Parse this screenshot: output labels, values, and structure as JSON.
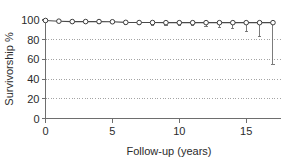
{
  "chart_data": {
    "type": "line",
    "title": "",
    "subtitle": "",
    "xlabel": "Follow-up (years)",
    "ylabel": "Survivorship %",
    "xlim": [
      0,
      17.6
    ],
    "ylim": [
      0,
      100
    ],
    "xticks": [
      0,
      5,
      10,
      15
    ],
    "xtick_labels": [
      "0",
      "5",
      "10",
      "15"
    ],
    "yticks": [
      0,
      20,
      40,
      60,
      80,
      100
    ],
    "ytick_labels": [
      "0",
      "20",
      "40",
      "60",
      "80",
      "100"
    ],
    "grid": "horizontal-dotted",
    "gridlines_at": [
      20,
      40,
      60,
      80
    ],
    "legend": "none",
    "marker": "open-circle",
    "errorbar_direction": "down",
    "x": [
      0,
      1,
      2,
      3,
      4,
      5,
      6,
      7,
      8,
      9,
      10,
      11,
      12,
      13,
      14,
      15,
      16,
      17
    ],
    "values": [
      99.5,
      98.8,
      98.4,
      98.4,
      98.4,
      98.2,
      97.6,
      97.4,
      97.4,
      97.3,
      97.3,
      97.3,
      97.3,
      97.3,
      97.3,
      97.3,
      97.3,
      97.3
    ],
    "lower_ci": [
      99.5,
      97.6,
      96.9,
      96.8,
      96.7,
      96.4,
      95.4,
      95.0,
      94.8,
      94.6,
      94.4,
      94.0,
      93.4,
      92.6,
      91.2,
      88.0,
      83.0,
      55.0
    ],
    "series": [
      {
        "name": "Survivorship",
        "values": [
          99.5,
          98.8,
          98.4,
          98.4,
          98.4,
          98.2,
          97.6,
          97.4,
          97.4,
          97.3,
          97.3,
          97.3,
          97.3,
          97.3,
          97.3,
          97.3,
          97.3,
          97.3
        ]
      }
    ]
  },
  "colors": {
    "axis": "#6e6e6e",
    "grid": "#9a9a9a",
    "line": "#4a4a4a",
    "marker_fill": "#ffffff",
    "marker_stroke": "#3d3d3d",
    "text": "#2b2b2b",
    "background": "#ffffff"
  }
}
